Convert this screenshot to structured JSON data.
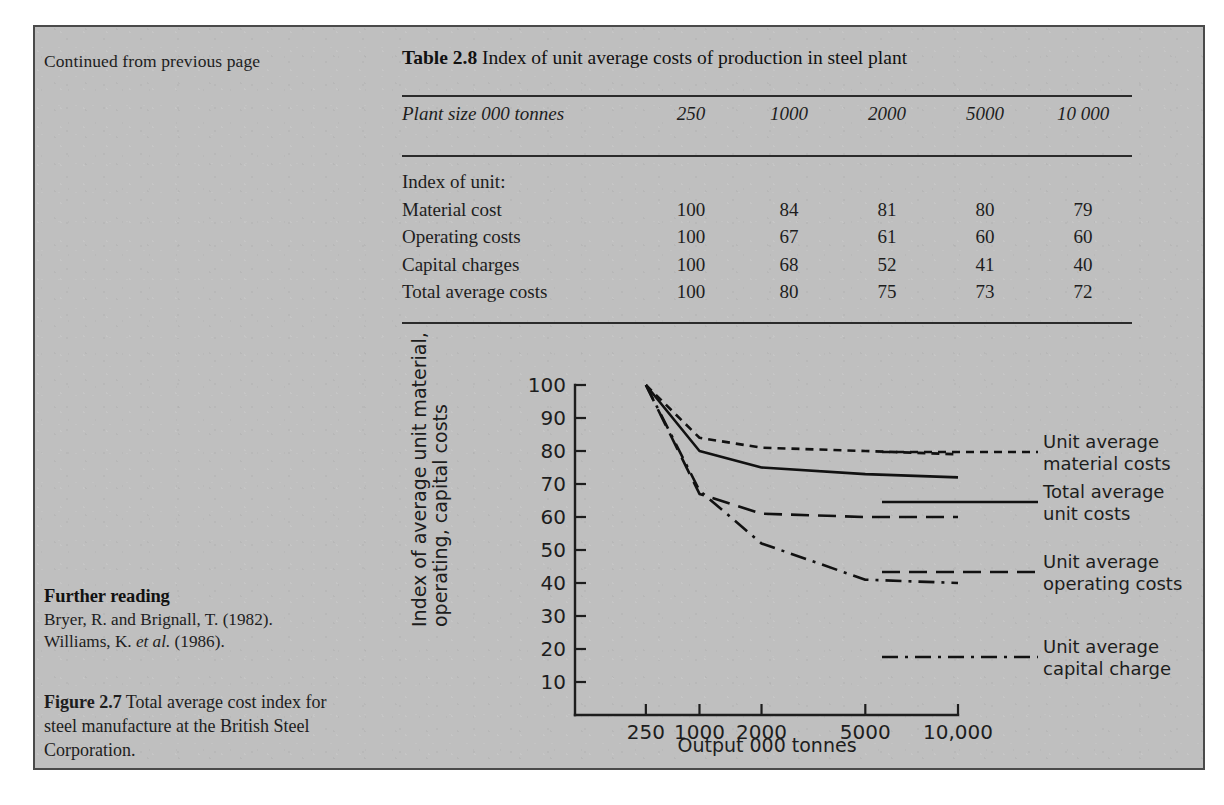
{
  "page": {
    "continued_note": "Continued from previous page"
  },
  "table": {
    "label": "Table 2.8",
    "title": "Index of unit average costs of production in steel plant",
    "header_label": "Plant size 000 tonnes",
    "columns": [
      "250",
      "1000",
      "2000",
      "5000",
      "10 000"
    ],
    "section_label": "Index of unit:",
    "rows": [
      {
        "label": "Material cost",
        "values": [
          "100",
          "84",
          "81",
          "80",
          "79"
        ]
      },
      {
        "label": "Operating costs",
        "values": [
          "100",
          "67",
          "61",
          "60",
          "60"
        ]
      },
      {
        "label": "Capital charges",
        "values": [
          "100",
          "68",
          "52",
          "41",
          "40"
        ]
      },
      {
        "label": "Total average costs",
        "values": [
          "100",
          "80",
          "75",
          "73",
          "72"
        ]
      }
    ]
  },
  "further_reading": {
    "heading": "Further reading",
    "entries": [
      {
        "pre": "Bryer, R. and Brignall, T. (1982).",
        "italic": "",
        "post": ""
      },
      {
        "pre": "Williams, K. ",
        "italic": "et al.",
        "post": " (1986)."
      }
    ]
  },
  "figure_caption": {
    "label": "Figure 2.7",
    "text": " Total average cost index for steel manufacture at the British Steel Corporation."
  },
  "chart_data": {
    "type": "line",
    "title": "",
    "xlabel": "Output 000 tonnes",
    "ylabel": "Index of average unit material, operating, capital costs",
    "x": [
      250,
      1000,
      2000,
      5000,
      10000
    ],
    "xtick_labels": [
      "250",
      "1000",
      "2000",
      "5000",
      "10,000"
    ],
    "ytick_labels": [
      "10",
      "20",
      "30",
      "40",
      "50",
      "60",
      "70",
      "80",
      "90",
      "100"
    ],
    "ylim": [
      0,
      100
    ],
    "grid": false,
    "legend_position": "right",
    "series": [
      {
        "name": "Unit average material costs",
        "legend_line1": "Unit average",
        "legend_line2": "material costs",
        "style": "short-dash",
        "values": [
          100,
          84,
          81,
          80,
          79
        ]
      },
      {
        "name": "Total average unit costs",
        "legend_line1": "Total average",
        "legend_line2": "unit costs",
        "style": "solid",
        "values": [
          100,
          80,
          75,
          73,
          72
        ]
      },
      {
        "name": "Unit average operating costs",
        "legend_line1": "Unit average",
        "legend_line2": "operating costs",
        "style": "long-dash",
        "values": [
          100,
          67,
          61,
          60,
          60
        ]
      },
      {
        "name": "Unit average capital charge",
        "legend_line1": "Unit average",
        "legend_line2": "capital charge",
        "style": "dash-dot",
        "values": [
          100,
          68,
          52,
          41,
          40
        ]
      }
    ]
  }
}
